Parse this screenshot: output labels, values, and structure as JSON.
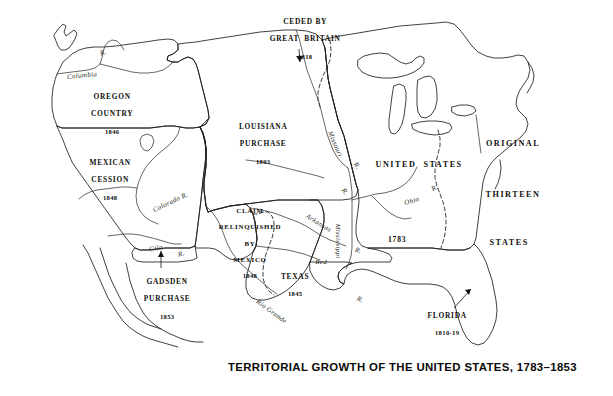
{
  "map": {
    "title": "TERRITORIAL GROWTH OF THE UNITED STATES, 1783–1853",
    "background_color": "#ffffff",
    "ocean_color": "#ffffff",
    "outline_color": "#1a1a18",
    "shades": {
      "very_light": "#e2e2de",
      "light": "#d4d4d0",
      "medium": "#c6c6c2",
      "dark": "#8d8d88",
      "lake": "#ffffff"
    },
    "territories": [
      {
        "name": "CEDED BY\nGREAT BRITAIN",
        "year": "1818",
        "shade": "medium",
        "leader": true
      },
      {
        "name": "OREGON\nCOUNTRY",
        "year": "1846",
        "shade": "light",
        "leader": false
      },
      {
        "name": "MEXICAN\nCESSION",
        "year": "1848",
        "shade": "dark",
        "leader": false
      },
      {
        "name": "GADSDEN\nPURCHASE",
        "year": "1853",
        "shade": "medium",
        "leader": true
      },
      {
        "name": "LOUISIANA\nPURCHASE",
        "year": "1803",
        "shade": "medium",
        "leader": false
      },
      {
        "name": "CLAIM\nRELINQUISHED\nBY\nMEXICO",
        "year": "1848",
        "shade": "medium",
        "leader": false
      },
      {
        "name": "TEXAS",
        "year": "1845",
        "shade": "medium",
        "leader": false
      },
      {
        "name": "FLORIDA",
        "year": "1810-19",
        "shade": "dark",
        "leader": true
      },
      {
        "name": "ORIGINAL\nTHIRTEEN\nSTATES",
        "year": "1783",
        "shade": "very_light",
        "leader": false
      }
    ],
    "labels": {
      "ceded_britain_l1": "CEDED BY",
      "ceded_britain_l2": "GREAT  BRITAIN",
      "ceded_britain_year": "1818",
      "oregon_l1": "OREGON",
      "oregon_l2": "COUNTRY",
      "oregon_year": "1846",
      "mexican_l1": "MEXICAN",
      "mexican_l2": "CESSION",
      "mexican_year": "1848",
      "gadsden_l1": "GADSDEN",
      "gadsden_l2": "PURCHASE",
      "gadsden_year": "1853",
      "louisiana_l1": "LOUISIANA",
      "louisiana_l2": "PURCHASE",
      "louisiana_year": "1803",
      "claim_l1": "CLAIM",
      "claim_l2": "RELINQUISHED",
      "claim_l3": "BY",
      "claim_l4": "MEXICO",
      "claim_year": "1848",
      "texas_l1": "TEXAS",
      "texas_year": "1845",
      "florida_l1": "FLORIDA",
      "florida_year": "1810-19",
      "united_states": "UNITED  STATES",
      "original": "ORIGINAL",
      "thirteen": "THIRTEEN",
      "states": "STATES",
      "year_1783": "1783"
    },
    "rivers": [
      {
        "name": "Columbia",
        "label": "Columbia"
      },
      {
        "name": "columbia-r",
        "label": "R."
      },
      {
        "name": "Colorado",
        "label": "Colorado R."
      },
      {
        "name": "Gila",
        "label": "Gila"
      },
      {
        "name": "gila-r",
        "label": "R."
      },
      {
        "name": "Rio Grande",
        "label": "Rio Grande"
      },
      {
        "name": "Missouri",
        "label": "Missouri"
      },
      {
        "name": "missouri-r",
        "label": "R."
      },
      {
        "name": "Arkansas",
        "label": "Arkansas"
      },
      {
        "name": "arkansas-r",
        "label": "R."
      },
      {
        "name": "Red",
        "label": "Red"
      },
      {
        "name": "red-r",
        "label": "R."
      },
      {
        "name": "Mississippi",
        "label": "Mississippi"
      },
      {
        "name": "Ohio",
        "label": "Ohio"
      },
      {
        "name": "ohio-r",
        "label": "R."
      }
    ],
    "river_labels": {
      "columbia": "Columbia",
      "columbia_r": "R.",
      "colorado": "Colorado R.",
      "gila": "Gila",
      "gila_r": "R.",
      "rio_grande": "Rio Grande",
      "missouri": "Missouri",
      "missouri_r1": "R.",
      "missouri_r2": "R.",
      "arkansas": "Arkansas",
      "arkansas_r": "R.",
      "red": "Red",
      "red_r": "R.",
      "mississippi": "Mississippi",
      "ohio": "Ohio",
      "ohio_r": "R."
    }
  }
}
